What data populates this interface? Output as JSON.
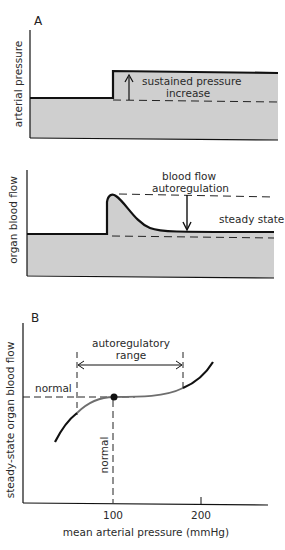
{
  "panel_a": {
    "label": "A",
    "top_chart": {
      "ylabel": "arterial pressure",
      "annotation_line1": "sustained pressure",
      "annotation_line2": "increase"
    },
    "bottom_chart": {
      "ylabel": "organ blood flow",
      "annotation_line1": "blood flow",
      "annotation_line2": "autoregulation",
      "steady_label": "steady state"
    }
  },
  "panel_b": {
    "label": "B",
    "ylabel": "steady-state organ blood flow",
    "xlabel": "mean arterial pressure (mmHg)",
    "range_line1": "autoregulatory",
    "range_line2": "range",
    "normal_flow_label": "normal",
    "normal_pressure_label": "normal",
    "ticks": [
      "100",
      "200"
    ]
  },
  "colors": {
    "fill_gray": "#cfcfcf",
    "line": "#111111",
    "curve_mid": "#6e6e6e"
  }
}
